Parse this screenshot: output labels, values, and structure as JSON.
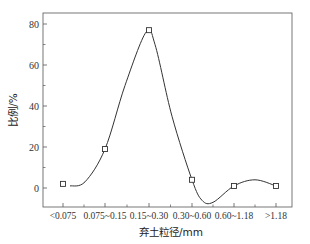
{
  "chart_data": {
    "type": "line",
    "title": "",
    "xlabel": "弃土粒径/mm",
    "ylabel": "比例/%",
    "categories": [
      "<0.075",
      "0.075~0.15",
      "0.15~0.30",
      "0.30~0.60",
      "0.60~1.18",
      ">1.18"
    ],
    "series": [
      {
        "name": "比例",
        "values": [
          2,
          19,
          77,
          4,
          1,
          1
        ],
        "marker": "open-square",
        "smoothed": true
      }
    ],
    "ylim": [
      -12,
      85
    ],
    "yticks": [
      0,
      20,
      40,
      60,
      80
    ],
    "grid": false,
    "legend": null
  },
  "colors": {
    "line": "#333333",
    "axis": "#555555",
    "background": "#ffffff"
  }
}
